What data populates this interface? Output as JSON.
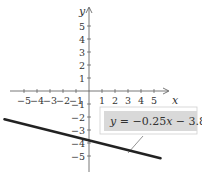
{
  "chart_data": {
    "type": "line",
    "title": "",
    "xlabel": "x",
    "ylabel": "y",
    "xlim": [
      -6.5,
      6
    ],
    "ylim": [
      -6,
      6.5
    ],
    "grid": false,
    "x_ticks": [
      -5,
      -4,
      -3,
      -2,
      -1,
      1,
      2,
      3,
      4,
      5
    ],
    "y_ticks": [
      -5,
      -4,
      -3,
      -2,
      -1,
      1,
      2,
      3,
      4,
      5
    ],
    "x_tick_labels": [
      "−5",
      "−4",
      "−3",
      "−2",
      "−1",
      "1",
      "2",
      "3",
      "4",
      "5"
    ],
    "y_tick_labels": [
      "−5",
      "−4",
      "−3",
      "−2",
      "−1",
      "1",
      "2",
      "3",
      "4",
      "5"
    ],
    "series": [
      {
        "name": "y = −0.25x − 3.8",
        "slope": -0.25,
        "intercept": -3.8,
        "x": [
          -6.5,
          5.5
        ],
        "y": [
          -2.175,
          -5.175
        ],
        "color": "#222222"
      }
    ],
    "annotations": [
      {
        "text": "y = −0.25x − 3.8",
        "points_to": {
          "x": 2.5,
          "y": -4.425
        }
      }
    ]
  },
  "callout": {
    "var": "y",
    "rest": " = −0.25",
    "var2": "x",
    "rest2": " − 3.8"
  },
  "axes": {
    "x_name": "x",
    "y_name": "y"
  },
  "colors": {
    "line": "#222222",
    "axis": "#555555",
    "callout_bg": "#d9d9d9",
    "callout_border": "#bdbdbd"
  }
}
